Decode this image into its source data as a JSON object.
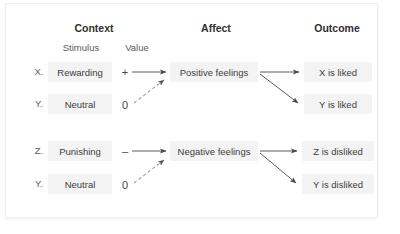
{
  "diagram": {
    "title_headers": {
      "context": "Context",
      "affect": "Affect",
      "outcome": "Outcome"
    },
    "sub_headers": {
      "stimulus": "Stimulus",
      "value": "Value"
    },
    "rows": [
      {
        "key": "X.",
        "stimulus": "Rewarding",
        "value": "+",
        "affect": "Positive feelings",
        "outcome": "X is liked",
        "link_type": "solid"
      },
      {
        "key": "Y.",
        "stimulus": "Neutral",
        "value": "0",
        "affect": "",
        "outcome": "Y is liked",
        "link_type": "dashed"
      },
      {
        "key": "Z.",
        "stimulus": "Punishing",
        "value": "–",
        "affect": "Negative feelings",
        "outcome": "Z is disliked",
        "link_type": "solid"
      },
      {
        "key": "Y.",
        "stimulus": "Neutral",
        "value": "0",
        "affect": "",
        "outcome": "Y is disliked",
        "link_type": "dashed"
      }
    ],
    "colors": {
      "node_fill": "#f3f3f3",
      "text": "#3d3d3d",
      "header_text": "#2f2f2f",
      "arrow": "#4a4a4a",
      "card_bg": "#ffffff",
      "card_border": "#efefef"
    }
  }
}
